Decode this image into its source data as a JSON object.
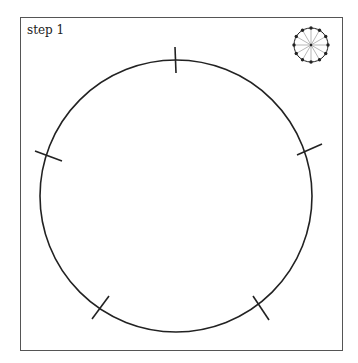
{
  "step_label": "step 1",
  "colors": {
    "stroke": "#222222",
    "frame": "#555555",
    "spoke": "#888888"
  },
  "main_circle": {
    "cx": 176,
    "cy": 196,
    "r": 136
  },
  "ticks": [
    {
      "x1": 175,
      "y1": 47,
      "x2": 176,
      "y2": 73
    },
    {
      "x1": 35,
      "y1": 151,
      "x2": 62,
      "y2": 161
    },
    {
      "x1": 297,
      "y1": 155,
      "x2": 322,
      "y2": 144
    },
    {
      "x1": 92,
      "y1": 319,
      "x2": 109,
      "y2": 296
    },
    {
      "x1": 253,
      "y1": 296,
      "x2": 269,
      "y2": 320
    }
  ],
  "thumbnail": {
    "cx": 311,
    "cy": 45,
    "r": 17,
    "points": 12
  }
}
